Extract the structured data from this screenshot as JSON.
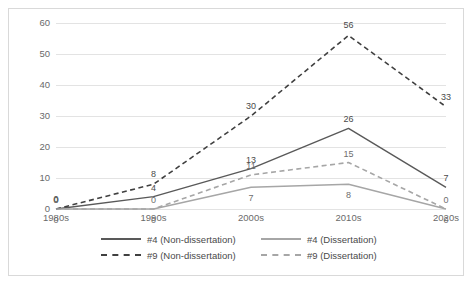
{
  "chart_data": {
    "type": "line",
    "title": "",
    "xlabel": "",
    "ylabel": "",
    "categories": [
      "1980s",
      "1990s",
      "2000s",
      "2010s",
      "2020s"
    ],
    "ylim": [
      0,
      60
    ],
    "yticks": [
      0,
      10,
      20,
      30,
      40,
      50,
      60
    ],
    "grid": true,
    "legend_position": "bottom",
    "series": [
      {
        "name": "#4 (Non-dissertation)",
        "values": [
          0,
          4,
          13,
          26,
          7
        ],
        "style": "solid",
        "color": "#595959"
      },
      {
        "name": "#4 (Dissertation)",
        "values": [
          0,
          0,
          7,
          8,
          0
        ],
        "style": "solid",
        "color": "#a6a6a6"
      },
      {
        "name": "#9 (Non-dissertation)",
        "values": [
          0,
          8,
          30,
          56,
          33
        ],
        "style": "dashed",
        "color": "#404040"
      },
      {
        "name": "#9 (Dissertation)",
        "values": [
          0,
          0,
          11,
          15,
          0
        ],
        "style": "dashed",
        "color": "#a6a6a6"
      }
    ]
  },
  "axis": {
    "y_tick_0": "0",
    "y_tick_10": "10",
    "y_tick_20": "20",
    "y_tick_30": "30",
    "y_tick_40": "40",
    "y_tick_50": "50",
    "y_tick_60": "60",
    "x_tick_1980s": "1980s",
    "x_tick_1990s": "1990s",
    "x_tick_2000s": "2000s",
    "x_tick_2010s": "2010s",
    "x_tick_2020s": "2020s"
  },
  "legend": {
    "item_1": "#4 (Non-dissertation)",
    "item_2": "#4 (Dissertation)",
    "item_3": "#9 (Non-dissertation)",
    "item_4": "#9 (Dissertation)"
  }
}
